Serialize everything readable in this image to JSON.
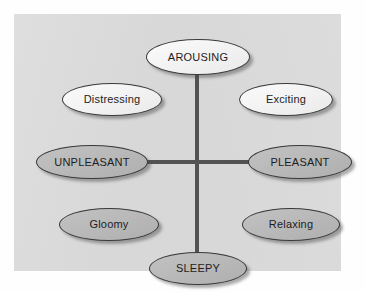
{
  "figure": {
    "panel_color": "#d8d8d8",
    "axis_color": "#535353",
    "node_light_color": "#f4f4f4",
    "node_shaded_color": "#b9b9b9",
    "text_color": "#1d1d1d"
  },
  "axes": {
    "vertical": {
      "name": "arousal-axis",
      "top_label": "AROUSING",
      "bottom_label": "SLEEPY"
    },
    "horizontal": {
      "name": "valence-axis",
      "left_label": "UNPLEASANT",
      "right_label": "PLEASANT"
    }
  },
  "nodes": [
    {
      "id": "arousing",
      "label": "AROUSING",
      "style": "light",
      "position": "top",
      "case": "upper"
    },
    {
      "id": "distressing",
      "label": "Distressing",
      "style": "light",
      "position": "upper-left",
      "case": "title"
    },
    {
      "id": "exciting",
      "label": "Exciting",
      "style": "light",
      "position": "upper-right",
      "case": "title"
    },
    {
      "id": "unpleasant",
      "label": "UNPLEASANT",
      "style": "shaded",
      "position": "left",
      "case": "upper"
    },
    {
      "id": "pleasant",
      "label": "PLEASANT",
      "style": "shaded",
      "position": "right",
      "case": "upper"
    },
    {
      "id": "gloomy",
      "label": "Gloomy",
      "style": "shaded",
      "position": "lower-left",
      "case": "title"
    },
    {
      "id": "relaxing",
      "label": "Relaxing",
      "style": "shaded",
      "position": "lower-right",
      "case": "title"
    },
    {
      "id": "sleepy",
      "label": "SLEEPY",
      "style": "shaded",
      "position": "bottom",
      "case": "upper"
    }
  ]
}
